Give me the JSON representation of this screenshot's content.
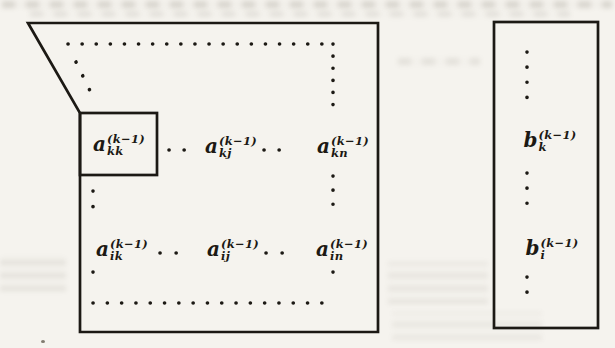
{
  "colors": {
    "ink": "#1c1914",
    "paper": "#f5f3ee"
  },
  "matrix": {
    "row_k": [
      {
        "base": "a",
        "sub": "kk",
        "sup": "(k−1)"
      },
      {
        "base": "a",
        "sub": "kj",
        "sup": "(k−1)"
      },
      {
        "base": "a",
        "sub": "kn",
        "sup": "(k−1)"
      }
    ],
    "row_i": [
      {
        "base": "a",
        "sub": "ik",
        "sup": "(k−1)"
      },
      {
        "base": "a",
        "sub": "ij",
        "sup": "(k−1)"
      },
      {
        "base": "a",
        "sub": "in",
        "sup": "(k−1)"
      }
    ]
  },
  "vector": {
    "entries": [
      {
        "base": "b",
        "sub": "k",
        "sup": "(k−1)"
      },
      {
        "base": "b",
        "sub": "i",
        "sup": "(k−1)"
      }
    ]
  }
}
